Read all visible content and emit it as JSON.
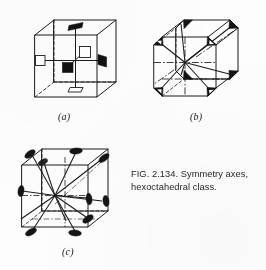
{
  "figure": {
    "caption_line1": "FIG. 2.134. Symmetry axes,",
    "caption_line2": "hexoctahedral class.",
    "number": "2.134",
    "subject": "Symmetry axes, hexoctahedral class",
    "background_color": "#fdfdfd",
    "ink_color": "#1a1a1a",
    "fill_color": "#111111"
  },
  "panels": [
    {
      "id": "a",
      "label": "(a)",
      "shape": "cube",
      "axis_type": "four-fold",
      "axis_count": 3,
      "marker_shape": "square",
      "description": "Cube with three four-fold axes of symmetry through face centres, marked by open and solid squares"
    },
    {
      "id": "b",
      "label": "(b)",
      "shape": "truncated-cube",
      "axis_type": "three-fold",
      "axis_count": 4,
      "marker_shape": "triangle",
      "description": "Truncated cube with four three-fold axes of symmetry through the corners, marked by solid triangles"
    },
    {
      "id": "c",
      "label": "(c)",
      "shape": "cube",
      "axis_type": "two-fold",
      "axis_count": 6,
      "marker_shape": "lens",
      "description": "Cube with six two-fold axes of symmetry through edge midpoints, marked by solid lenses"
    }
  ]
}
